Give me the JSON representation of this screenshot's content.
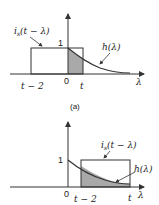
{
  "colors": {
    "line": "#333333",
    "shade": "#a9a9a9",
    "background": "#ffffff"
  },
  "panel_a": {
    "caption": "(a)",
    "input_label": "i_s(t − λ)",
    "input_label_main": "i",
    "input_label_sub": "s",
    "input_label_rest": "(t − λ)",
    "response_label": "h(λ)",
    "y_tick": "1",
    "x_labels": {
      "left": "t − 2",
      "origin": "0",
      "right": "t",
      "axis": "λ"
    }
  },
  "panel_b": {
    "input_label_main": "i",
    "input_label_sub": "s",
    "input_label_rest": "(t − λ)",
    "response_label": "h(λ)",
    "y_tick": "1",
    "x_labels": {
      "origin": "0",
      "left": "t − 2",
      "right": "t",
      "axis": "λ"
    }
  }
}
